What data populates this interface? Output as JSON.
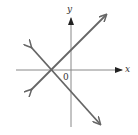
{
  "diagram": {
    "type": "coordinate-plane-lines",
    "axes": {
      "x_label": "x",
      "y_label": "y",
      "origin_label": "0"
    },
    "lines": [
      {
        "name": "line-positive-slope",
        "description": "increasing line crossing x-axis left of origin, y-intercept above origin",
        "color": "#666666"
      },
      {
        "name": "line-negative-slope",
        "description": "decreasing line crossing x-axis at same point, y-intercept below origin",
        "color": "#666666"
      }
    ],
    "colors": {
      "axis": "#888888",
      "line": "#666666",
      "text": "#333333"
    }
  }
}
